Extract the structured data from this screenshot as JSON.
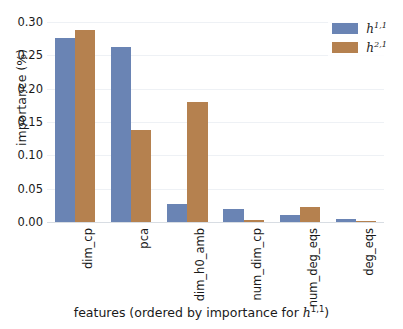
{
  "chart_data": {
    "type": "bar",
    "title": "",
    "xlabel": "features (ordered by importance for h^{1,1})",
    "xlabel_plain": "features (ordered by importance for ",
    "xlabel_math_base": "h",
    "xlabel_math_sup": "1,1",
    "xlabel_tail": ")",
    "ylabel": "importance (%)",
    "categories": [
      "dim_cp",
      "pca",
      "dim_h0_amb",
      "num_dim_cp",
      "num_deg_eqs",
      "deg_eqs"
    ],
    "series": [
      {
        "name": "h^{1,1}",
        "name_base": "h",
        "name_sup": "1,1",
        "color": "#6a84b4",
        "values": [
          0.276,
          0.262,
          0.027,
          0.02,
          0.011,
          0.005
        ]
      },
      {
        "name": "h^{2,1}",
        "name_base": "h",
        "name_sup": "2,1",
        "color": "#b5814f",
        "values": [
          0.288,
          0.138,
          0.18,
          0.003,
          0.023,
          0.002
        ]
      }
    ],
    "ylim": [
      0.0,
      0.3
    ],
    "yticks": [
      0.0,
      0.05,
      0.1,
      0.15,
      0.2,
      0.25,
      0.3
    ],
    "ytick_labels": [
      "0.00",
      "0.05",
      "0.10",
      "0.15",
      "0.20",
      "0.25",
      "0.30"
    ],
    "grid": true,
    "grid_axis": "y",
    "legend_position": "upper right",
    "background_color": "#ffffff",
    "gridline_color": "#eef1f5"
  }
}
